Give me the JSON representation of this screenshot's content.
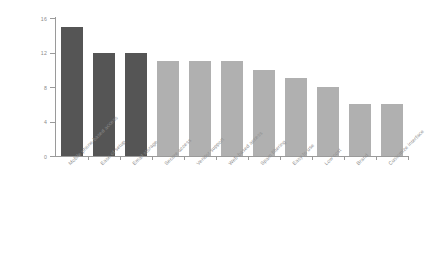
{
  "chart_data": {
    "type": "bar",
    "title": "",
    "subtitle": "",
    "xlabel": "",
    "ylabel": "",
    "ylim": [
      0,
      16
    ],
    "yticks": [
      "0",
      "4",
      "8",
      "12",
      "16"
    ],
    "ytick_values": [
      0,
      4,
      8,
      12,
      16
    ],
    "grid": false,
    "legend": false,
    "legend_position": "none",
    "categories": [
      "Mobile phone-based access",
      "Ease of setup",
      "Email storage",
      "Secure access",
      "Vendor support",
      "Web-based access",
      "Spam filtering",
      "Easy to use",
      "Low cost",
      "Brand",
      "Customize interface"
    ],
    "values": [
      15,
      12,
      12,
      11,
      11,
      11,
      10,
      9,
      8,
      6,
      6
    ],
    "bar_colors": [
      "#555555",
      "#555555",
      "#555555",
      "#b0b0b0",
      "#b0b0b0",
      "#b0b0b0",
      "#b0b0b0",
      "#b0b0b0",
      "#b0b0b0",
      "#b0b0b0",
      "#b0b0b0"
    ]
  },
  "style": {
    "background": "#ffffff",
    "axis_color": "#9a9a9a",
    "tick_label_color": "#8a8a8a",
    "category_label_color": "#8d8d8d",
    "dark_bar": "#555555",
    "light_bar": "#b0b0b0"
  }
}
